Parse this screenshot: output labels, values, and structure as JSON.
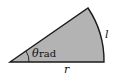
{
  "diagram": {
    "type": "circular-sector",
    "colors": {
      "fill": "#b3b3b3",
      "stroke": "#1a1a1a",
      "background": "#ffffff"
    },
    "labels": {
      "angle_symbol": "θ",
      "angle_unit": " rad",
      "arc_length": "l",
      "radius": "r"
    }
  }
}
